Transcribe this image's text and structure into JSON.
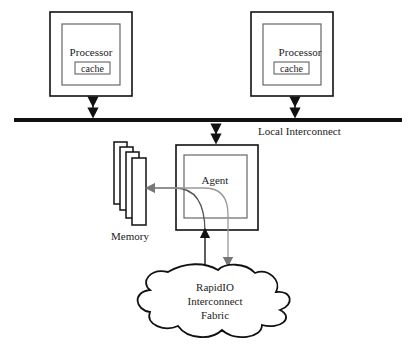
{
  "diagram": {
    "processors": [
      {
        "label": "Processor",
        "cache_label": "cache"
      },
      {
        "label": "Processor",
        "cache_label": "cache"
      }
    ],
    "bus": {
      "label": "Local Interconnect"
    },
    "agent": {
      "label": "Agent"
    },
    "memory": {
      "label": "Memory"
    },
    "fabric": {
      "line1": "RapidIO",
      "line2": "Interconnect",
      "line3": "Fabric"
    },
    "colors": {
      "line": "#111111",
      "inner_box": "#666666",
      "flow_arrow": "#888888"
    }
  }
}
